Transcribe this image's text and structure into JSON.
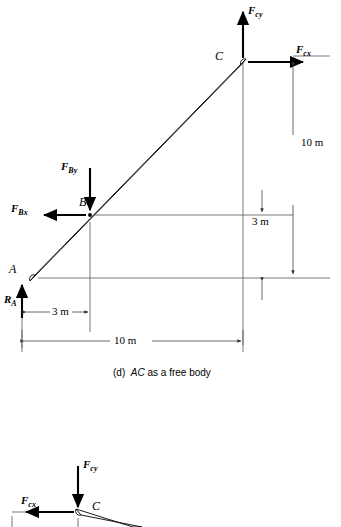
{
  "figure": {
    "caption_prefix": "(d)",
    "caption_italic": "AC",
    "caption_rest": "as a free body"
  },
  "panel_main": {
    "points": [
      {
        "name": "point-label-A",
        "text": "A"
      },
      {
        "name": "point-label-B",
        "text": "B"
      },
      {
        "name": "point-label-C",
        "text": "C"
      }
    ],
    "forces": [
      {
        "name": "force-Fcy",
        "symbol": "F",
        "sub": "cy",
        "direction": "up"
      },
      {
        "name": "force-Fcx",
        "symbol": "F",
        "sub": "cx",
        "direction": "right"
      },
      {
        "name": "force-Fby",
        "symbol": "F",
        "sub": "By",
        "direction": "down"
      },
      {
        "name": "force-Fbx",
        "symbol": "F",
        "sub": "Bx",
        "direction": "left"
      },
      {
        "name": "force-Ra",
        "symbol": "R",
        "sub": "A",
        "direction": "up"
      }
    ],
    "dimensions": [
      {
        "name": "dim-vertical-10m",
        "text": "10 m",
        "orientation": "vertical"
      },
      {
        "name": "dim-vertical-3m",
        "text": "3 m",
        "orientation": "vertical"
      },
      {
        "name": "dim-horizontal-3m",
        "text": "3 m",
        "orientation": "horizontal"
      },
      {
        "name": "dim-horizontal-10m",
        "text": "10 m",
        "orientation": "horizontal"
      }
    ]
  },
  "panel_bottom": {
    "points": [
      {
        "name": "point-label-C",
        "text": "C"
      }
    ],
    "forces": [
      {
        "name": "force-Fcy",
        "symbol": "F",
        "sub": "cy",
        "direction": "down"
      },
      {
        "name": "force-Fcx",
        "symbol": "F",
        "sub": "cx",
        "direction": "left"
      }
    ]
  },
  "colors": {
    "ink": "#000000",
    "thin_rule": "#555555",
    "background": "#ffffff"
  }
}
